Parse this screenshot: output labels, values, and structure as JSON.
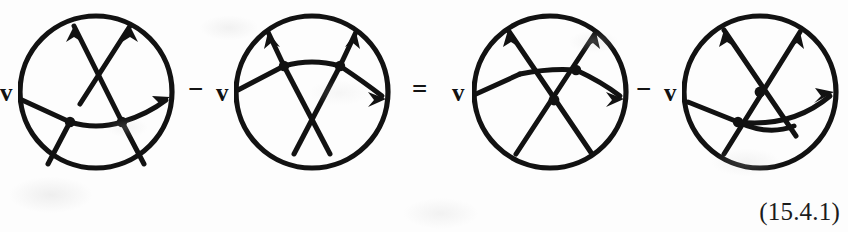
{
  "document": {
    "type": "mathematical-equation",
    "equation_number": "(15.4.1)",
    "background_color": "#fdfdfd",
    "ink_color": "#121212"
  },
  "equation": {
    "terms": [
      {
        "id": "term-1",
        "coefficient": "v",
        "diagram": "chord-diagram-1"
      },
      {
        "id": "term-2",
        "coefficient": "v",
        "diagram": "chord-diagram-2"
      },
      {
        "id": "term-3",
        "coefficient": "v",
        "diagram": "chord-diagram-3"
      },
      {
        "id": "term-4",
        "coefficient": "v",
        "diagram": "chord-diagram-4"
      }
    ],
    "operators": [
      {
        "id": "op-1",
        "symbol": "−",
        "name": "minus-sign"
      },
      {
        "id": "op-2",
        "symbol": "=",
        "name": "equals-sign"
      },
      {
        "id": "op-3",
        "symbol": "−",
        "name": "minus-sign"
      }
    ]
  },
  "diagrams": [
    {
      "id": "chord-diagram-1",
      "label": "first-chord-diagram",
      "arrow_count": 3,
      "vertex_count": 2,
      "crossing_count": 1,
      "description": "circle with two trivalent vertices on a lower horizontal chord and a long crossing strand"
    },
    {
      "id": "chord-diagram-2",
      "label": "second-chord-diagram",
      "arrow_count": 3,
      "vertex_count": 2,
      "crossing_count": 1,
      "description": "circle with two trivalent vertices on an upper horizontal chord and a crossing below"
    },
    {
      "id": "chord-diagram-3",
      "label": "third-chord-diagram",
      "arrow_count": 3,
      "vertex_count": 1,
      "crossing_count": 1,
      "description": "circle with a central crossing and one trivalent vertex upper right"
    },
    {
      "id": "chord-diagram-4",
      "label": "fourth-chord-diagram",
      "arrow_count": 3,
      "vertex_count": 1,
      "crossing_count": 1,
      "description": "circle with a central crossing and one trivalent vertex lower left"
    }
  ]
}
